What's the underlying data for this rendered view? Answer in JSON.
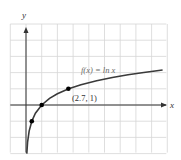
{
  "chart_data": {
    "type": "line",
    "title": "",
    "xlabel": "x",
    "ylabel": "y",
    "grid": true,
    "xlim": [
      -1,
      9
    ],
    "ylim": [
      -3,
      5
    ],
    "series": [
      {
        "name": "f(x) = ln x",
        "function": "ln x",
        "x": [
          0.05,
          0.1,
          0.2,
          0.368,
          0.6,
          1,
          1.5,
          2,
          2.718,
          3.5,
          4.5,
          5.5,
          6.5,
          7.5,
          8.7
        ],
        "y": [
          -3.0,
          -2.3,
          -1.61,
          -1.0,
          -0.51,
          0,
          0.41,
          0.69,
          1.0,
          1.25,
          1.5,
          1.7,
          1.87,
          2.01,
          2.16
        ],
        "color": "#3a3a3a"
      }
    ],
    "points": [
      {
        "x": 0.368,
        "y": -1,
        "label": ""
      },
      {
        "x": 1,
        "y": 0,
        "label": ""
      },
      {
        "x": 2.7,
        "y": 1,
        "label": "(2.7, 1)"
      }
    ],
    "annotations": [
      {
        "text": "f(x) = ln x",
        "x": 5.5,
        "y": 2.0
      },
      {
        "text": "(2.7, 1)",
        "x": 3.0,
        "y": 0.5
      }
    ]
  },
  "labels": {
    "x_axis": "x",
    "y_axis": "y",
    "function_label": "f(x) = ln x",
    "point_label": "(2.7, 1)"
  },
  "colors": {
    "grid": "#d6d6d6",
    "axis": "#333333",
    "curve": "#3a3a3a",
    "point": "#000000",
    "function_label": "#6a6a6a",
    "point_label": "#333333"
  }
}
